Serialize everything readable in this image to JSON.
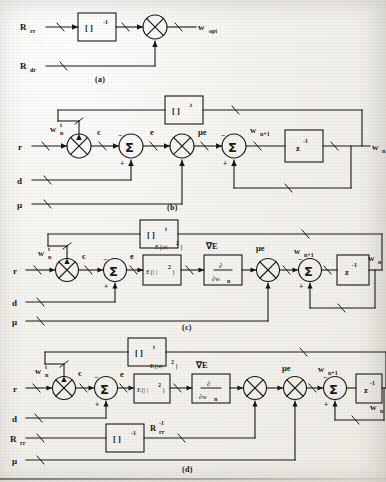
{
  "figure": {
    "kind": "signal-flow-block-diagrams",
    "panels": [
      {
        "id": "a",
        "caption": "(a)",
        "inputs": [
          "R",
          "R"
        ],
        "input_labels": [
          {
            "base": "R",
            "sub": "rr",
            "sup": ""
          },
          {
            "base": "R",
            "sub": "dr",
            "sup": ""
          }
        ],
        "blocks": [
          {
            "name": "inverse-block",
            "text": "[ ]",
            "sup": "-1"
          }
        ],
        "operators": [
          "multiplier"
        ],
        "output": {
          "base": "w",
          "sub": "opt",
          "sup": ""
        }
      },
      {
        "id": "b",
        "caption": "(b)",
        "inputs": [
          {
            "base": "r",
            "sub": "",
            "sup": ""
          },
          {
            "base": "d",
            "sub": "",
            "sup": ""
          },
          {
            "base": "μ",
            "sub": "",
            "sup": ""
          }
        ],
        "blocks": [
          {
            "name": "transpose-block",
            "text": "[ ]",
            "sup": "t"
          },
          {
            "name": "delay-block",
            "text": "z",
            "sup": "-1"
          }
        ],
        "node_labels": [
          {
            "base": "w",
            "sub": "n",
            "sup": "t"
          },
          {
            "base": "c",
            "sub": "",
            "sup": ""
          },
          {
            "base": "e",
            "sub": "",
            "sup": ""
          },
          {
            "base": "μe",
            "sub": "",
            "sup": ""
          },
          {
            "base": "w",
            "sub": "n+1",
            "sup": ""
          }
        ],
        "output": {
          "base": "w",
          "sub": "n",
          "sup": ""
        },
        "signs": [
          "-",
          "+",
          "-",
          "+"
        ]
      },
      {
        "id": "c",
        "caption": "(c)",
        "inputs": [
          {
            "base": "r",
            "sub": "",
            "sup": ""
          },
          {
            "base": "d",
            "sub": "",
            "sup": ""
          },
          {
            "base": "μ",
            "sub": "",
            "sup": ""
          }
        ],
        "blocks": [
          {
            "name": "transpose-block",
            "text": "[ ]",
            "sup": "t"
          },
          {
            "name": "expectation-block",
            "text": "E{| |",
            "sup": "2",
            "tail": "}"
          },
          {
            "name": "gradient-block",
            "num": "∂",
            "den_base": "∂w",
            "den_sub": "n"
          },
          {
            "name": "delay-block",
            "text": "z",
            "sup": "-1"
          }
        ],
        "node_labels": [
          {
            "base": "w",
            "sub": "n",
            "sup": "t"
          },
          {
            "base": "c",
            "sub": "",
            "sup": ""
          },
          {
            "base": "e",
            "sub": "",
            "sup": ""
          },
          {
            "base": "E{|e|",
            "sub": "",
            "sup": "2",
            "tail": "}"
          },
          {
            "base": "∇E",
            "sub": "",
            "sup": ""
          },
          {
            "base": "μe",
            "sub": "",
            "sup": ""
          },
          {
            "base": "w",
            "sub": "n+1",
            "sup": ""
          }
        ],
        "output": {
          "base": "w",
          "sub": "n",
          "sup": ""
        },
        "signs": [
          "-",
          "+",
          "-",
          "+"
        ]
      },
      {
        "id": "d",
        "caption": "(d)",
        "inputs": [
          {
            "base": "r",
            "sub": "",
            "sup": ""
          },
          {
            "base": "d",
            "sub": "",
            "sup": ""
          },
          {
            "base": "R",
            "sub": "rr",
            "sup": ""
          },
          {
            "base": "μ",
            "sub": "",
            "sup": ""
          }
        ],
        "blocks": [
          {
            "name": "transpose-block",
            "text": "[ ]",
            "sup": "t"
          },
          {
            "name": "expectation-block",
            "text": "E{| |",
            "sup": "2",
            "tail": "}"
          },
          {
            "name": "gradient-block",
            "num": "∂",
            "den_base": "∂w",
            "den_sub": "n"
          },
          {
            "name": "inverse-block",
            "text": "[ ]",
            "sup": "-1"
          },
          {
            "name": "delay-block",
            "text": "z",
            "sup": "-1"
          }
        ],
        "node_labels": [
          {
            "base": "w",
            "sub": "n",
            "sup": "t"
          },
          {
            "base": "c",
            "sub": "",
            "sup": ""
          },
          {
            "base": "e",
            "sub": "",
            "sup": ""
          },
          {
            "base": "E{|e|",
            "sub": "",
            "sup": "2",
            "tail": "}"
          },
          {
            "base": "∇E",
            "sub": "",
            "sup": ""
          },
          {
            "base": "R",
            "sub": "rr",
            "sup": "-1"
          },
          {
            "base": "μe",
            "sub": "",
            "sup": ""
          },
          {
            "base": "w",
            "sub": "n+1",
            "sup": ""
          }
        ],
        "output": {
          "base": "w",
          "sub": "n",
          "sup": ""
        },
        "signs": [
          "-",
          "+",
          "-",
          "+"
        ]
      }
    ],
    "glyphs": {
      "multiplier": "⊗",
      "summer": "Σ",
      "minus": "-",
      "plus": "+"
    },
    "colors": {
      "ink": "#141414",
      "paper": "#f4f2ee"
    }
  }
}
